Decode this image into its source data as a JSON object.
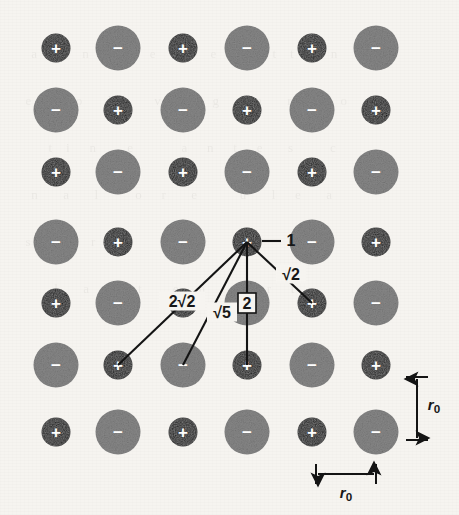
{
  "figure": {
    "background_color": "#f6f4f0",
    "width": 459,
    "height": 515,
    "ghost_text": "   a    c  n      r   e    ti   e    s    t  t      n\n  e   s   o    l       v   n    g      a    r    i   o\n      t  i   n     e        a   n   t   e    s      c\n   n    a    l      o   r    e       u    l   e    a\n  s      t   r    e      n     c    t   i     o    n\n       l    a   i    t     e   n     s    r   t\n"
  },
  "lattice": {
    "description": "Alternating positive and negative ion checkerboard, 6 columns x 7 rows",
    "columns_x": [
      56,
      118,
      183,
      247,
      312,
      376
    ],
    "rows_y": [
      48,
      110,
      172,
      242,
      303,
      365,
      432
    ],
    "positive": {
      "sign": "+",
      "radius": 14.5,
      "fill": "#1c1c1c",
      "sign_font_size": 17
    },
    "negative": {
      "sign": "−",
      "radius": 22.5,
      "fill": "#878787",
      "sign_font_size": 17
    },
    "rows": [
      {
        "row": 0,
        "cells": [
          "+",
          "−",
          "+",
          "−",
          "+",
          "−"
        ]
      },
      {
        "row": 1,
        "cells": [
          "−",
          "+",
          "−",
          "+",
          "−",
          "+"
        ]
      },
      {
        "row": 2,
        "cells": [
          "+",
          "−",
          "+",
          "−",
          "+",
          "−"
        ]
      },
      {
        "row": 3,
        "cells": [
          "−",
          "+",
          "−",
          "+",
          "−",
          "+"
        ]
      },
      {
        "row": 4,
        "cells": [
          "+",
          "−",
          "+",
          "−",
          "+",
          "−"
        ]
      },
      {
        "row": 5,
        "cells": [
          "−",
          "+",
          "−",
          "+",
          "−",
          "+"
        ]
      },
      {
        "row": 6,
        "cells": [
          "+",
          "−",
          "+",
          "−",
          "+",
          "−"
        ]
      }
    ]
  },
  "reference_ion": {
    "label": "1",
    "x": 247,
    "y": 242,
    "sign": "+",
    "leader_line": {
      "x1": 262,
      "y1": 241,
      "x2": 281,
      "y2": 241
    },
    "label_x": 291,
    "label_y": 240,
    "label_font_size": 16
  },
  "distance_bonds": [
    {
      "name": "sqrt2-bond",
      "label": "√2",
      "from_x": 247,
      "from_y": 242,
      "to_x": 312,
      "to_y": 303,
      "label_x": 291,
      "label_y": 274,
      "label_font_size": 16,
      "plate_w": 30,
      "plate_h": 19,
      "boxed": false
    },
    {
      "name": "two-bond",
      "label": "2",
      "from_x": 247,
      "from_y": 242,
      "to_x": 247,
      "to_y": 365,
      "label_x": 247,
      "label_y": 303,
      "label_font_size": 16,
      "plate_w": 18,
      "plate_h": 20,
      "boxed": true
    },
    {
      "name": "sqrt5-bond",
      "label": "√5",
      "from_x": 247,
      "from_y": 242,
      "to_x": 183,
      "to_y": 365,
      "label_x": 222,
      "label_y": 312,
      "label_font_size": 16,
      "plate_w": 30,
      "plate_h": 19,
      "boxed": false
    },
    {
      "name": "two-sqrt2-bond",
      "label": "2√2",
      "from_x": 247,
      "from_y": 242,
      "to_x": 118,
      "to_y": 365,
      "label_x": 182,
      "label_y": 301,
      "label_font_size": 16,
      "plate_w": 46,
      "plate_h": 19,
      "boxed": false
    }
  ],
  "scale_bars": {
    "vertical": {
      "label": "r",
      "subscript": "0",
      "x": 417,
      "y_top": 377,
      "y_bottom": 440,
      "cap_half_width": 11,
      "label_x": 434,
      "label_y": 404,
      "label_font_size": 15
    },
    "horizontal": {
      "label": "r",
      "subscript": "0",
      "y": 474,
      "x_left": 316,
      "x_right": 376,
      "cap_half_height": 10,
      "label_x": 346,
      "label_y": 492,
      "label_font_size": 15
    }
  }
}
